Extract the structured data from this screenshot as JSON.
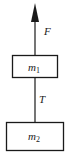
{
  "diagram": {
    "force_label": "F",
    "tension_label": "T",
    "upper_block": {
      "label_base": "m",
      "label_sub": "1"
    },
    "lower_block": {
      "label_base": "m",
      "label_sub": "2"
    },
    "colors": {
      "stroke": "#1a1a1a",
      "background": "#ffffff"
    }
  }
}
